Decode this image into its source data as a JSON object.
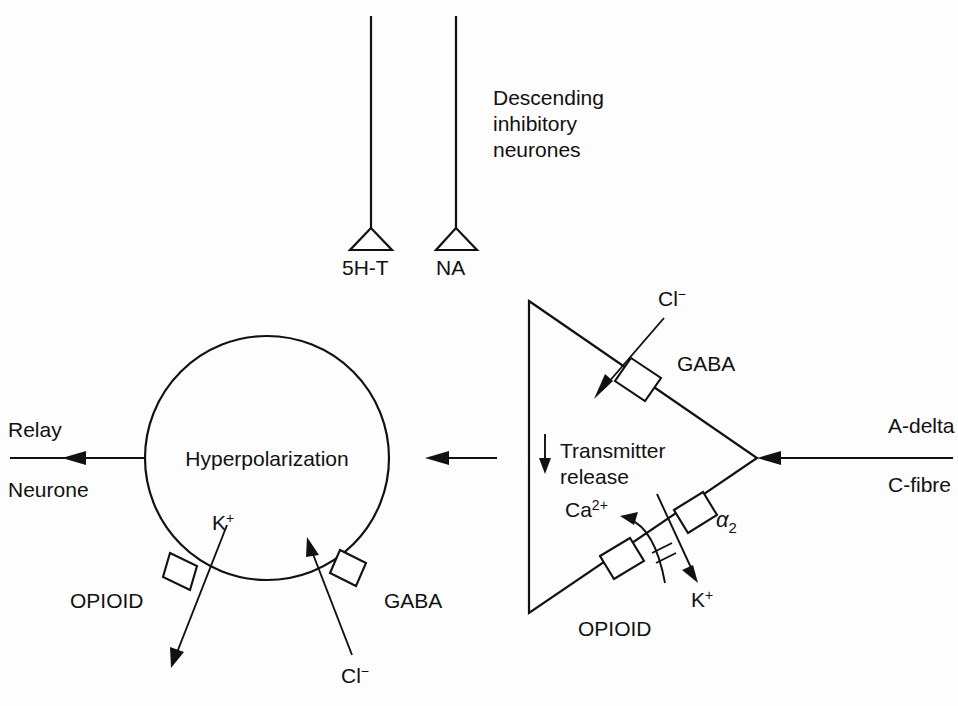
{
  "diagram": {
    "background_color": "#fdfdfd",
    "line_color": "#111111"
  },
  "descending": {
    "caption_line1": "Descending",
    "caption_line2": "inhibitory",
    "caption_line3": "neurones",
    "terminals": [
      {
        "label": "5H-T"
      },
      {
        "label": "NA"
      }
    ]
  },
  "presynaptic_terminal": {
    "transmitter_line1": "Transmitter",
    "transmitter_line2": "release",
    "receptors": [
      {
        "name": "GABA",
        "ion": "Cl",
        "ion_charge": "−"
      },
      {
        "name": "α",
        "name_sub": "2",
        "ion": "K",
        "ion_charge": "+"
      },
      {
        "name": "OPIOID",
        "ion": "Ca",
        "ion_charge": "2+"
      }
    ]
  },
  "postsynaptic_neurone": {
    "center_label": "Hyperpolarization",
    "receptors": [
      {
        "name": "OPIOID",
        "ion": "K",
        "ion_charge": "+"
      },
      {
        "name": "GABA",
        "ion": "Cl",
        "ion_charge": "−"
      }
    ]
  },
  "afferent": {
    "label_line1": "A-delta",
    "label_line2": "C-fibre"
  },
  "output": {
    "label_line1": "Relay",
    "label_line2": "Neurone"
  }
}
